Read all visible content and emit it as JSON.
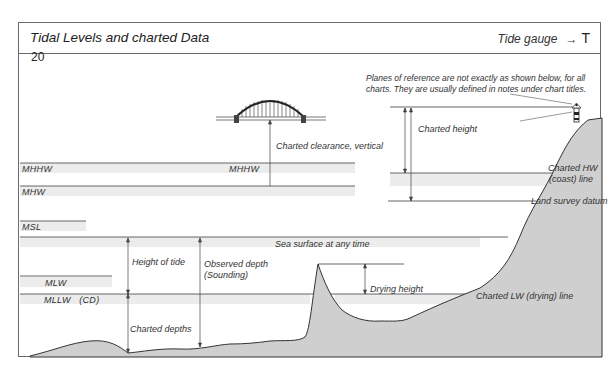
{
  "header": {
    "title": "Tidal Levels and charted Data",
    "gauge_label": "Tide gauge",
    "gauge_arrow": "→",
    "gauge_symbol": "T"
  },
  "figure_number": "20",
  "note": {
    "line1": "Planes of reference are not exactly as shown below, for all",
    "line2": "charts. They are usually defined in notes under chart titles."
  },
  "levels": {
    "mhhw_left": "MHHW",
    "mhhw_center": "MHHW",
    "mhw": "MHW",
    "msl": "MSL",
    "mlw": "MLW",
    "mllw": "MLLW   (CD)"
  },
  "labels": {
    "charted_clearance": "Charted clearance, vertical",
    "charted_height": "Charted height",
    "charted_hw_line1": "Charted HW",
    "charted_hw_line2": "(coast) line",
    "land_survey_datum": "Land survey datum",
    "sea_surface": "Sea surface at any time",
    "height_of_tide": "Height of tide",
    "observed_depth_line1": "Observed depth",
    "observed_depth_line2": "(Sounding)",
    "drying_height": "Drying height",
    "charted_lw_line": "Charted LW (drying) line",
    "charted_depths": "Charted depths"
  },
  "colors": {
    "frame": "#6a6a6a",
    "land": "#cfcfcf",
    "band": "#ececec",
    "line": "#444444"
  }
}
